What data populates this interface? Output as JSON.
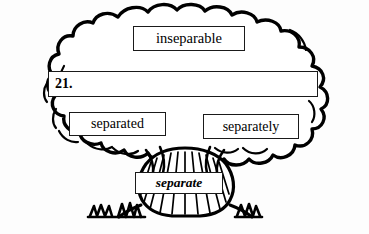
{
  "worksheet": {
    "item_number_label": "21.",
    "diagram_type": "word-family-tree",
    "root_word": "separate",
    "canopy_words": [
      {
        "id": "inseparable",
        "label": "inseparable"
      },
      {
        "id": "separated",
        "label": "separated"
      },
      {
        "id": "separately",
        "label": "separately"
      }
    ],
    "answer_blank": {
      "number": "21.",
      "value": ""
    }
  },
  "colors": {
    "ink": "#000000",
    "outline": "#1a1a1a",
    "background": "#fdfdfd",
    "box_fill": "#ffffff"
  },
  "icons": {
    "tree": "tree-icon",
    "canopy": "cloud-canopy-icon",
    "trunk": "tree-trunk-icon",
    "grass_left": "grass-tuft-icon",
    "grass_right": "grass-tuft-icon"
  }
}
